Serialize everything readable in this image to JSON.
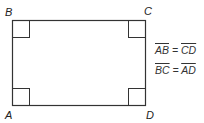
{
  "diagram": {
    "shape": "rectangle",
    "vertices": [
      {
        "label": "A",
        "position": "bottom-left"
      },
      {
        "label": "B",
        "position": "top-left"
      },
      {
        "label": "C",
        "position": "top-right"
      },
      {
        "label": "D",
        "position": "bottom-right"
      }
    ],
    "right_angle_markers": 4,
    "equations": [
      {
        "left": "AB",
        "op": "=",
        "right": "CD"
      },
      {
        "left": "BC",
        "op": "=",
        "right": "AD"
      }
    ],
    "stroke_color": "#333333"
  }
}
